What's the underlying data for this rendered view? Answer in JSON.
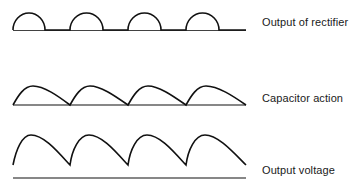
{
  "diagram": {
    "rows": [
      {
        "id": "rectifier",
        "label": "Output of rectifier"
      },
      {
        "id": "capacitor",
        "label": "Capacitor action"
      },
      {
        "id": "output",
        "label": "Output voltage"
      }
    ],
    "stroke_color": "#111111"
  }
}
